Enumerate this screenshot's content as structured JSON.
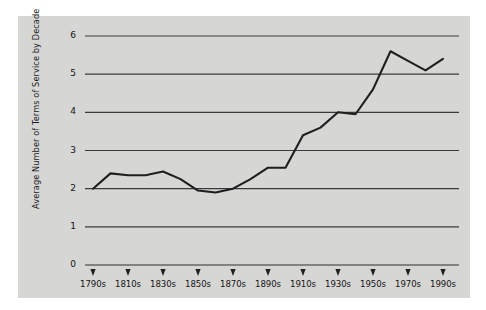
{
  "figure": {
    "background_color": "#ffffff",
    "panel_color": "#d6d6d4",
    "line_color": "#1f1f1f",
    "grid_color": "#3a3a3a"
  },
  "chart_data": {
    "type": "line",
    "title": "",
    "xlabel": "",
    "ylabel": "Average Number of Terms of Service by Decade",
    "ylim": [
      0,
      6
    ],
    "yticks": [
      0,
      1,
      2,
      3,
      4,
      5,
      6
    ],
    "ytick_labels": [
      "0",
      "1",
      "2",
      "3",
      "4",
      "5",
      "6"
    ],
    "grid": true,
    "grid_axis": "y",
    "legend": "none",
    "xtick_labels": [
      "1790s",
      "1810s",
      "1830s",
      "1850s",
      "1870s",
      "1890s",
      "1910s",
      "1930s",
      "1950s",
      "1970s",
      "1990s"
    ],
    "categories": [
      "1790s",
      "1800s",
      "1810s",
      "1820s",
      "1830s",
      "1840s",
      "1850s",
      "1860s",
      "1870s",
      "1880s",
      "1890s",
      "1900s",
      "1910s",
      "1920s",
      "1930s",
      "1940s",
      "1950s",
      "1960s",
      "1970s",
      "1980s",
      "1990s"
    ],
    "values": [
      2.0,
      2.4,
      2.35,
      2.35,
      2.45,
      2.25,
      1.95,
      1.9,
      2.0,
      2.25,
      2.55,
      2.55,
      3.4,
      3.6,
      4.0,
      3.95,
      4.6,
      5.6,
      5.35,
      5.1,
      5.4
    ],
    "series": [
      {
        "name": "Average Number of Terms of Service by Decade",
        "values": [
          2.0,
          2.4,
          2.35,
          2.35,
          2.45,
          2.25,
          1.95,
          1.9,
          2.0,
          2.25,
          2.55,
          2.55,
          3.4,
          3.6,
          4.0,
          3.95,
          4.6,
          5.6,
          5.35,
          5.1,
          5.4
        ]
      }
    ]
  }
}
